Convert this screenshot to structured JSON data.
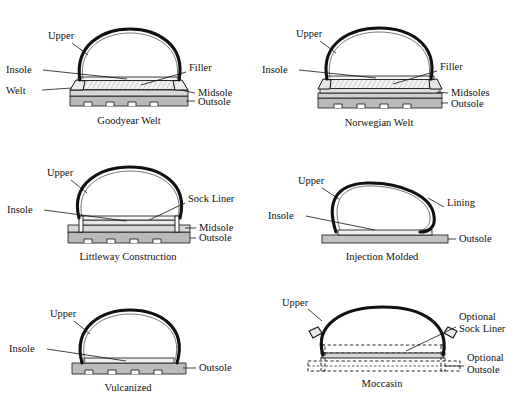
{
  "figure": {
    "type": "technical-diagram",
    "background": "#ffffff",
    "ink": "#111111"
  },
  "palette": {
    "outsole_fill": "#b9b9b9",
    "midsole_fill": "#d8d8d8",
    "insole_fill": "#eeeeee",
    "filler_hatch": "#cfcfcf",
    "line": "#111111"
  },
  "diagrams": [
    {
      "id": "goodyear-welt",
      "caption": "Goodyear Welt",
      "labels": {
        "upper": "Upper",
        "insole": "Insole",
        "welt": "Welt",
        "filler": "Filler",
        "midsole": "Midsole",
        "outsole": "Outsole"
      },
      "layers": [
        "Insole",
        "Filler",
        "Midsole",
        "Outsole"
      ],
      "notes": "Hatched filler between insole and midsole; welt wings at both edges; notched outsole tread"
    },
    {
      "id": "norwegian-welt",
      "caption": "Norwegian Welt",
      "labels": {
        "upper": "Upper",
        "insole": "Insole",
        "filler": "Filler",
        "midsoles": "Midsoles",
        "outsole": "Outsole"
      },
      "layers": [
        "Insole",
        "Filler",
        "Midsoles",
        "Outsole"
      ],
      "notes": "Two stacked midsole layers; upper turned outward at edges"
    },
    {
      "id": "littleway-construction",
      "caption": "Littleway Construction",
      "labels": {
        "upper": "Upper",
        "insole": "Insole",
        "sock_liner": "Sock Liner",
        "midsole": "Midsole",
        "outsole": "Outsole"
      },
      "layers": [
        "Sock Liner",
        "Insole",
        "Midsole",
        "Outsole"
      ],
      "notes": "Vertical stitch pegs through insole and midsole at both edges"
    },
    {
      "id": "injection-molded",
      "caption": "Injection Molded",
      "labels": {
        "upper": "Upper",
        "insole": "Insole",
        "lining": "Lining",
        "outsole": "Outsole"
      },
      "layers": [
        "Insole",
        "Outsole"
      ],
      "notes": "Double-line upper with inner lining; flat single outsole slab, no tread"
    },
    {
      "id": "vulcanized",
      "caption": "Vulcanized",
      "labels": {
        "upper": "Upper",
        "insole": "Insole",
        "outsole": "Outsole"
      },
      "layers": [
        "Insole",
        "Outsole"
      ],
      "notes": "Upper wraps down onto notched outsole; no midsole"
    },
    {
      "id": "moccasin",
      "caption": "Moccasin",
      "labels": {
        "upper": "Upper",
        "optional_sock_liner": "Optional\nSock Liner",
        "optional_sock_liner_line1": "Optional",
        "optional_sock_liner_line2": "Sock Liner",
        "optional_outsole_line1": "Optional",
        "optional_outsole_line2": "Outsole"
      },
      "layers": [
        "Optional Sock Liner",
        "Optional Outsole"
      ],
      "notes": "Dashed outlines mark optional parts; small stitched tabs on both upper sides"
    }
  ]
}
